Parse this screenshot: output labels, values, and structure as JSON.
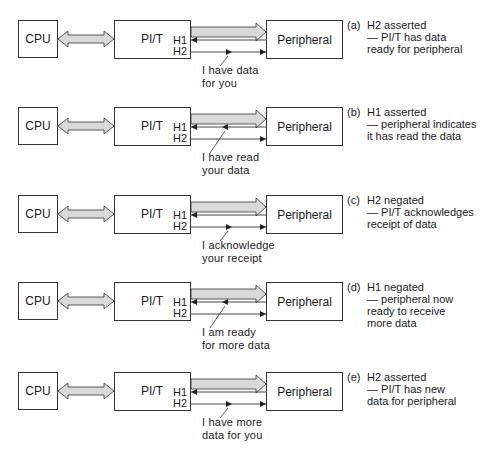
{
  "labels": {
    "cpu": "CPU",
    "pit": "PI/T",
    "peripheral": "Peripheral",
    "h1": "H1",
    "h2": "H2"
  },
  "colors": {
    "data_bus_fill": "#d9d9d9",
    "line": "#333333"
  },
  "rows": [
    {
      "tag": "(a)",
      "desc": [
        "H2 asserted",
        "— PI/T has data",
        "ready for peripheral"
      ],
      "caption": [
        "I have data",
        "for you"
      ],
      "active_line": "H2",
      "pointer_direction": "right"
    },
    {
      "tag": "(b)",
      "desc": [
        "H1 asserted",
        "— peripheral indicates",
        "it has read the data"
      ],
      "caption": [
        "I have read",
        "your data"
      ],
      "active_line": "H1",
      "pointer_direction": "left"
    },
    {
      "tag": "(c)",
      "desc": [
        "H2 negated",
        "— PI/T acknowledges",
        "receipt of data"
      ],
      "caption": [
        "I acknowledge",
        "your receipt"
      ],
      "active_line": "H2",
      "pointer_direction": "right"
    },
    {
      "tag": "(d)",
      "desc": [
        "H1 negated",
        "— peripheral now",
        "ready to receive",
        "more data"
      ],
      "caption": [
        "I am ready",
        "for more data"
      ],
      "active_line": "H1",
      "pointer_direction": "left"
    },
    {
      "tag": "(e)",
      "desc": [
        "H2 asserted",
        "— PI/T has new",
        "data for peripheral"
      ],
      "caption": [
        "I have more",
        "data for you"
      ],
      "active_line": "H2",
      "pointer_direction": "right"
    }
  ]
}
